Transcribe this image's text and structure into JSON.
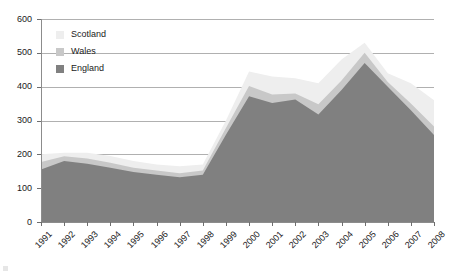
{
  "chart_data": {
    "type": "area",
    "stacked": true,
    "title": "",
    "xlabel": "",
    "ylabel": "",
    "categories": [
      "1991",
      "1992",
      "1993",
      "1994",
      "1995",
      "1996",
      "1997",
      "1998",
      "1999",
      "2000",
      "2001",
      "2002",
      "2003",
      "2004",
      "2005",
      "2006",
      "2007",
      "2008"
    ],
    "series": [
      {
        "name": "England",
        "color": "#808080",
        "values": [
          155,
          180,
          172,
          160,
          148,
          140,
          132,
          140,
          258,
          372,
          352,
          362,
          318,
          390,
          470,
          400,
          330,
          257
        ]
      },
      {
        "name": "Wales",
        "color": "#c8c8c8",
        "values": [
          22,
          14,
          16,
          15,
          12,
          12,
          12,
          12,
          20,
          30,
          25,
          18,
          30,
          28,
          30,
          14,
          20,
          25
        ]
      },
      {
        "name": "Scotland",
        "color": "#eeeeee",
        "values": [
          23,
          11,
          17,
          20,
          20,
          18,
          21,
          18,
          22,
          43,
          53,
          45,
          62,
          62,
          30,
          26,
          60,
          78
        ]
      }
    ],
    "totals": [
      200,
      205,
      205,
      195,
      180,
      170,
      165,
      170,
      300,
      445,
      430,
      425,
      410,
      480,
      530,
      440,
      410,
      360
    ],
    "ylim": [
      0,
      600
    ],
    "yticks": [
      0,
      100,
      200,
      300,
      400,
      500,
      600
    ],
    "ytick_labels": [
      "0",
      "100",
      "200",
      "300",
      "400",
      "500",
      "600"
    ],
    "grid": true,
    "legend_position": "inside-top-left",
    "legend_order": [
      "Scotland",
      "Wales",
      "England"
    ]
  },
  "legend": {
    "entries": [
      {
        "label": "Scotland",
        "color": "#eeeeee"
      },
      {
        "label": "Wales",
        "color": "#c8c8c8"
      },
      {
        "label": "England",
        "color": "#808080"
      }
    ]
  },
  "colors": {
    "scotland": "#eeeeee",
    "wales": "#c8c8c8",
    "england": "#808080",
    "grid": "#b0b0b0",
    "axis": "#8c8c8c",
    "text": "#1a1a1a"
  }
}
